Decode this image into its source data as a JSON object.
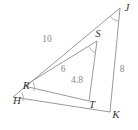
{
  "figure": {
    "type": "geometry-diagram",
    "canvas": {
      "width": 138,
      "height": 130,
      "background": "#ffffff"
    },
    "colors": {
      "stroke": "#9a9a9a",
      "vertex_label": "#3a3a3a",
      "side_label": "#8a8a8a",
      "arc": "#a8a8a8"
    },
    "outer_triangle": {
      "name": "HJK",
      "vertices": [
        {
          "id": "H",
          "label": "H",
          "x": 17,
          "y": 104,
          "point_x": 13,
          "point_y": 97
        },
        {
          "id": "J",
          "label": "J",
          "x": 127,
          "y": 11,
          "point_x": 120,
          "point_y": 8
        },
        {
          "id": "K",
          "label": "K",
          "x": 116,
          "y": 118,
          "point_x": 110,
          "point_y": 112
        }
      ],
      "sides": [
        {
          "from": "H",
          "to": "J",
          "label": "10",
          "label_x": 47,
          "label_y": 42
        },
        {
          "from": "J",
          "to": "K",
          "label": "8",
          "label_x": 122,
          "label_y": 72
        },
        {
          "from": "K",
          "to": "H",
          "label": "",
          "label_x": 0,
          "label_y": 0
        }
      ]
    },
    "inner_triangle": {
      "name": "RST",
      "vertices": [
        {
          "id": "R",
          "label": "R",
          "x": 26,
          "y": 89,
          "point_x": 24,
          "point_y": 86
        },
        {
          "id": "S",
          "label": "S",
          "x": 98,
          "y": 37,
          "point_x": 97,
          "point_y": 41
        },
        {
          "id": "T",
          "label": "T",
          "x": 92,
          "y": 108,
          "point_x": 89,
          "point_y": 101
        }
      ],
      "sides": [
        {
          "from": "R",
          "to": "S",
          "label": "6",
          "label_x": 63,
          "label_y": 72
        },
        {
          "from": "S",
          "to": "T",
          "label": "4.8",
          "label_x": 77,
          "label_y": 83
        },
        {
          "from": "T",
          "to": "R",
          "label": "",
          "label_x": 0,
          "label_y": 0
        }
      ]
    },
    "angle_marks": [
      {
        "at": "H",
        "name": "angle-arc-h"
      },
      {
        "at": "R",
        "name": "angle-arc-r"
      },
      {
        "at": "S",
        "name": "angle-arc-s"
      },
      {
        "at": "J",
        "name": "angle-arc-j"
      }
    ],
    "paths": {
      "outer": "M 13 97 L 120 8 L 110 112 Z",
      "inner": "M 24 86 L 97 41 L 89 101 Z",
      "arc_h": "M 22 93 A 10 10 0 0 1 23 101",
      "arc_r": "M 33 82 A 11 11 0 0 1 34 91",
      "arc_s": "M 89 47 A 12 12 0 0 0 96 53",
      "arc_j": "M 110 16 A 12 12 0 0 0 118 21"
    }
  }
}
